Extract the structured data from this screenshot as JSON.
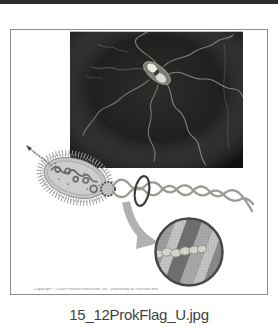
{
  "page": {
    "top_bar_color": "#2c2c2c",
    "background": "#ffffff"
  },
  "thumbnail": {
    "caption": "15_12ProkFlag_U.jpg",
    "frame_border_color": "#8e8e8e",
    "copyright_line": "Copyright © 2008 Pearson Education, Inc., publishing as Pearson Benjamin Cummings. All rights reserved.",
    "micrograph": {
      "background": "#1b1b1a",
      "flagella_color": "#95958b",
      "cell_body_color": "#7d7d75",
      "cell_highlight_color": "#ecece4"
    },
    "illustration": {
      "body_color": "#c9c9c9",
      "body_outline_color": "#8c8c8c",
      "fimbriae_color": "#a0a0a0",
      "nucleoid_color": "#6b6b6b",
      "flagellum_color": "#9b9b93",
      "rotation_ring_color": "#3c3c3c",
      "zoom_arrow_color": "#b1b1b1",
      "inset": {
        "border_color": "#474747",
        "base_color": "#b9b9b9",
        "bands": [
          "#9e9e9e",
          "#c4c4c4",
          "#6f6f6f",
          "#a8a8a8",
          "#c4c4c4",
          "#8a8a8a"
        ],
        "braid_color": "#d7d7cd",
        "braid_outline_color": "#8e8e84"
      }
    }
  }
}
